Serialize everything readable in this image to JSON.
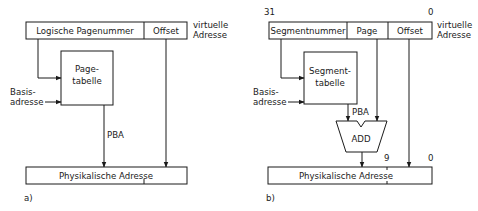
{
  "diagram_a": {
    "caption": "a)",
    "virtual_address": {
      "fields": [
        "Logische Pagenummer",
        "Offset"
      ],
      "side_label_line1": "virtuelle",
      "side_label_line2": "Adresse"
    },
    "table": {
      "line1": "Page-",
      "line2": "tabelle"
    },
    "base_label_line1": "Basis-",
    "base_label_line2": "adresse",
    "pba_label": "PBA",
    "physical_address": "Physikalische Adresse"
  },
  "diagram_b": {
    "caption": "b)",
    "bit_high": "31",
    "bit_low": "0",
    "virtual_address": {
      "fields": [
        "Segmentnummer",
        "Page",
        "Offset"
      ],
      "side_label_line1": "virtuelle",
      "side_label_line2": "Adresse"
    },
    "table": {
      "line1": "Segment-",
      "line2": "tabelle"
    },
    "base_label_line1": "Basis-",
    "base_label_line2": "adresse",
    "pba_label": "PBA",
    "adder_label": "ADD",
    "phys_bit_9": "9",
    "phys_bit_0": "0",
    "physical_address": "Physikalische Adresse"
  }
}
